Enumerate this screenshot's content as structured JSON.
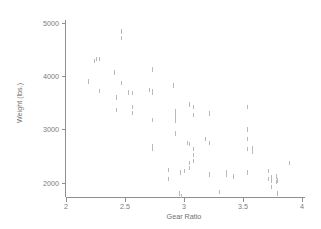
{
  "figure": {
    "background_color": "#ffffff",
    "axis_color": "#8f8f8f",
    "text_color": "#7c7c7c",
    "marker_color": "#b9b9bd"
  },
  "chart_data": {
    "type": "scatter",
    "title": "",
    "xlabel": "Gear Ratio",
    "ylabel": "Weight (lbs.)",
    "xlim": [
      2,
      4
    ],
    "ylim": [
      1760,
      5100
    ],
    "xticks": [
      2,
      2.5,
      3,
      3.5,
      4
    ],
    "xticklabels": [
      "2",
      "2.5",
      "3",
      "3.5",
      "4"
    ],
    "yticks": [
      2000,
      3000,
      4000,
      5000
    ],
    "yticklabels": [
      "2000",
      "3000",
      "4000",
      "5000"
    ],
    "grid": false,
    "legend": null,
    "marker": "small-vertical-tick",
    "series": [
      {
        "name": "automobiles",
        "x": [
          2.19,
          2.24,
          2.26,
          2.28,
          2.28,
          2.41,
          2.41,
          2.43,
          2.43,
          2.47,
          2.47,
          2.47,
          2.53,
          2.56,
          2.56,
          2.56,
          2.71,
          2.73,
          2.73,
          2.73,
          2.73,
          2.73,
          2.73,
          2.73,
          2.87,
          2.87,
          2.91,
          2.93,
          2.93,
          2.93,
          2.93,
          2.93,
          2.93,
          2.93,
          2.96,
          2.97,
          2.98,
          3.0,
          3.03,
          3.05,
          3.05,
          3.05,
          3.05,
          3.08,
          3.08,
          3.08,
          3.08,
          3.08,
          3.18,
          3.22,
          3.22,
          3.22,
          3.3,
          3.36,
          3.36,
          3.42,
          3.54,
          3.54,
          3.54,
          3.54,
          3.54,
          3.58,
          3.58,
          3.72,
          3.72,
          3.74,
          3.74,
          3.74,
          3.78,
          3.78,
          3.79,
          3.79,
          3.89,
          3.89
        ],
        "y": [
          3900,
          4290,
          4330,
          4330,
          3720,
          4080,
          4060,
          3600,
          3370,
          4840,
          4720,
          3880,
          3700,
          3690,
          3420,
          3310,
          3740,
          4130,
          3690,
          3180,
          2690,
          2650,
          3730,
          3720,
          2240,
          2070,
          3830,
          3280,
          3250,
          3210,
          3170,
          3350,
          3310,
          2930,
          1800,
          2200,
          1760,
          2230,
          2750,
          3470,
          2730,
          2370,
          2280,
          3420,
          3280,
          2640,
          2520,
          2410,
          2830,
          3300,
          2750,
          2160,
          1830,
          2200,
          2160,
          2120,
          3420,
          3000,
          2830,
          2640,
          2200,
          2650,
          2580,
          2230,
          2070,
          2110,
          2050,
          1930,
          2120,
          2020,
          2050,
          1800,
          2380,
          2370
        ]
      }
    ]
  }
}
